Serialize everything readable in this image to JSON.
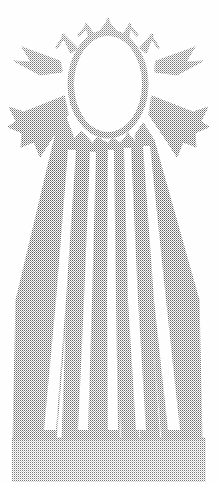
{
  "artwork": {
    "title": "Halftone Sun with Radiating Beams",
    "medium": "dithered halftone engraving",
    "width": 218,
    "height": 482,
    "background_color": "#fefefe",
    "ink_color": "#4a4a4a",
    "halftone": {
      "pattern": "checkerboard-dither",
      "cell_size_px": 2,
      "description": "fine two-pixel checkered dot screen"
    }
  },
  "elements": {
    "disc": {
      "name": "sun-disc",
      "shape": "oval",
      "center_x": 108,
      "center_y": 84,
      "radius_x": 37,
      "radius_y": 51,
      "fill": "white",
      "outline": "halftone-dot-ring",
      "outline_thickness_px": 6
    },
    "crown_spikes": {
      "name": "crown-spikes",
      "count": 5,
      "description": "short forked spikes above the disc"
    },
    "side_wings": {
      "name": "side-wings",
      "count": 4,
      "description": "two broad wing beams on each flank"
    },
    "lower_beams": {
      "name": "lower-beams",
      "count": 7,
      "description": "long tapering beams fanning down to the base"
    },
    "base_block": {
      "name": "base-halftone-block",
      "top_y": 438,
      "bottom_y": 482,
      "left_x": 12,
      "right_x": 206,
      "description": "solid halftone field where the beams merge"
    }
  },
  "palette": {
    "paper": "#fefefe",
    "ink": "#4a4a4a",
    "ink_light": "#9a9a9a",
    "ink_mid": "#6d6d6d"
  }
}
